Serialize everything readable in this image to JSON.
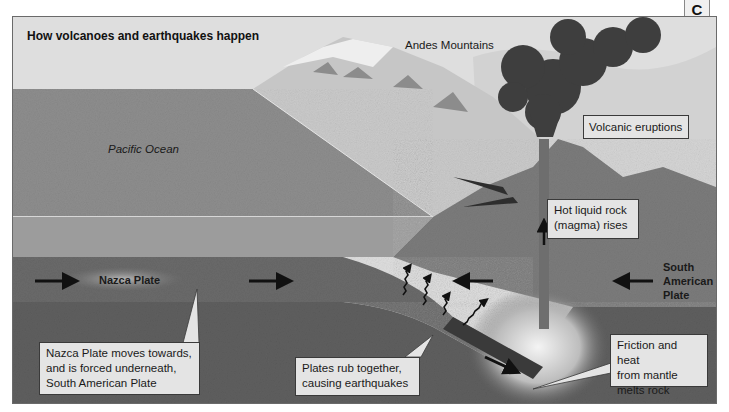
{
  "diagram": {
    "title": "How volcanoes and earthquakes happen",
    "section_tab": "C",
    "region_labels": {
      "ocean": "Pacific Ocean",
      "mountains": "Andes Mountains",
      "nazca_plate": "Nazca Plate",
      "south_american_plate": "South\nAmerican\nPlate"
    },
    "callouts": {
      "volcanic_eruptions": "Volcanic eruptions",
      "magma_rises": "Hot liquid rock\n(magma) rises",
      "nazca_subduction": "Nazca Plate moves towards,\nand is forced underneath,\nSouth American Plate",
      "earthquakes": "Plates rub together,\ncausing earthquakes",
      "friction_heat": "Friction and heat\nfrom mantle\nmelts rock"
    },
    "icons": {
      "plate_motion_arrows": "arrow-right / arrow-left",
      "seismic_waves": "wavy-arrow",
      "magma_arrow": "arrow-up"
    },
    "colors": {
      "sky": "#dedede",
      "ocean_surface": "#8e8e8e",
      "ocean_water": "#9c9c9c",
      "mountain_face": "#c8c8c8",
      "crust_continental": "#7c7c7c",
      "nazca_plate": "#6a6a6a",
      "mantle": "#5f5f5f",
      "smoke": "#3e3e3e",
      "callout_bg": "#e4e4e4"
    }
  }
}
